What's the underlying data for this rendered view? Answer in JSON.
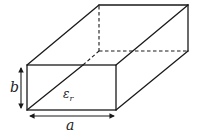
{
  "diagram": {
    "type": "rectangular-waveguide-3d",
    "labels": {
      "width": "a",
      "height": "b",
      "permittivity_symbol": "ε",
      "permittivity_subscript": "r"
    },
    "colors": {
      "line": "#1a1a1a",
      "background": "#ffffff"
    }
  }
}
